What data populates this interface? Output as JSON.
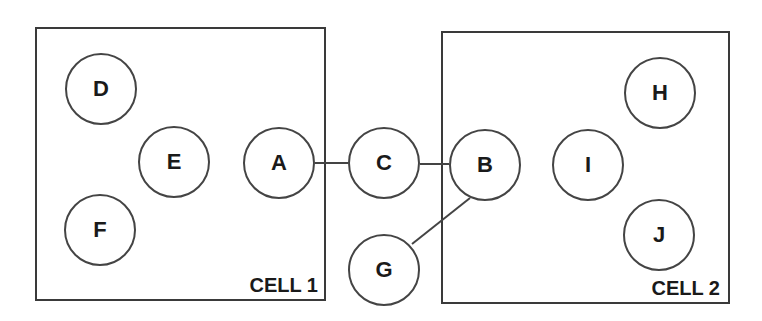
{
  "diagram": {
    "cells": [
      {
        "id": "cell1",
        "label": "CELL 1"
      },
      {
        "id": "cell2",
        "label": "CELL 2"
      }
    ],
    "nodes": {
      "A": "A",
      "B": "B",
      "C": "C",
      "D": "D",
      "E": "E",
      "F": "F",
      "G": "G",
      "H": "H",
      "I": "I",
      "J": "J"
    },
    "edges": [
      {
        "from": "A",
        "to": "C"
      },
      {
        "from": "C",
        "to": "B"
      },
      {
        "from": "B",
        "to": "G"
      }
    ],
    "membership": {
      "cell1": [
        "D",
        "E",
        "F",
        "A"
      ],
      "cell2": [
        "B",
        "I",
        "H",
        "J"
      ],
      "outside": [
        "C",
        "G"
      ]
    },
    "colors": {
      "stroke": "#444444",
      "text": "#1a1a1a",
      "background": "#ffffff"
    }
  }
}
